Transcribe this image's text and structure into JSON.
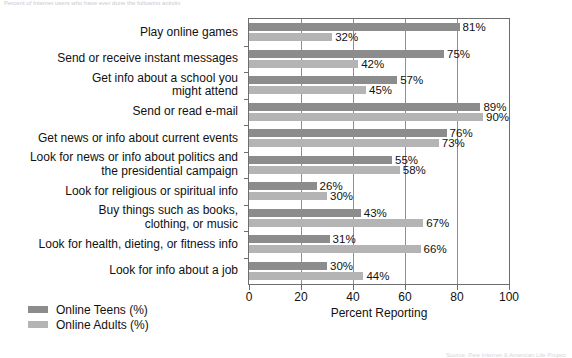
{
  "figure": {
    "top_caption": "Percent of Internet users who have ever done the following activity",
    "footnote": "Source: Pew Internet & American Life Project"
  },
  "chart_data": {
    "type": "bar",
    "orientation": "horizontal",
    "title": "",
    "subtitle": "",
    "xlabel": "Percent Reporting",
    "ylabel": "",
    "xlim": [
      0,
      100
    ],
    "xticks": [
      0,
      20,
      40,
      60,
      80,
      100
    ],
    "grid": "vertical",
    "legend_position": "below-left",
    "categories": [
      "Play online games",
      "Send or receive instant messages",
      "Get info about a school you\nmight attend",
      "Send or read e-mail",
      "Get news or info about current events",
      "Look for news or info about politics and\nthe presidential campaign",
      "Look for religious or spiritual info",
      "Buy things such as books,\nclothing, or music",
      "Look for health, dieting, or fitness info",
      "Look for info about a job"
    ],
    "series": [
      {
        "name": "Online Teens (%)",
        "color": "#8c8c8c",
        "values": [
          81,
          75,
          57,
          89,
          76,
          55,
          26,
          43,
          31,
          30
        ],
        "labels": [
          "81%",
          "75%",
          "57%",
          "89%",
          "76%",
          "55%",
          "26%",
          "43%",
          "31%",
          "30%"
        ]
      },
      {
        "name": "Online Adults (%)",
        "color": "#b4b4b4",
        "values": [
          32,
          42,
          45,
          90,
          73,
          58,
          30,
          67,
          66,
          44
        ],
        "labels": [
          "32%",
          "42%",
          "45%",
          "90%",
          "73%",
          "58%",
          "30%",
          "67%",
          "66%",
          "44%"
        ]
      }
    ]
  }
}
